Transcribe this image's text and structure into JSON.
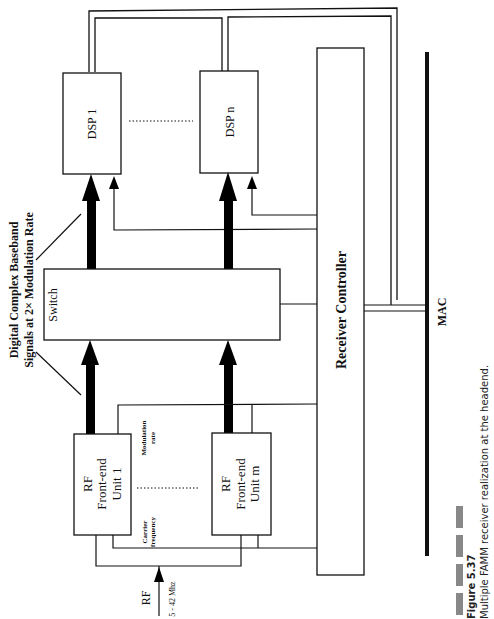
{
  "diagram": {
    "title": "Multiple FAMM receiver realization at the headend",
    "blocks": {
      "dsp1": "DSP 1",
      "dspn": "DSP n",
      "switch": "Switch",
      "receiver_controller": "Receiver Controller",
      "rf1_line1": "RF",
      "rf1_line2": "Front-end",
      "rf1_line3": "Unit 1",
      "rfm_line1": "RF",
      "rfm_line2": "Front-end",
      "rfm_line3": "Unit m",
      "mac": "MAC"
    },
    "labels": {
      "baseband_line1": "Digital Complex Baseband",
      "baseband_line2": "Signals at 2× Modulation Rate",
      "modulation_line1": "Modulation",
      "modulation_line2": "rate",
      "carrier_line1": "Carrier",
      "carrier_line2": "frequency",
      "rf_input": "RF",
      "rf_range": "5 - 42 Mhz"
    },
    "caption": {
      "figure_number": "Figure 5.37",
      "text": "Multiple FAMM receiver realization at the headend."
    }
  }
}
